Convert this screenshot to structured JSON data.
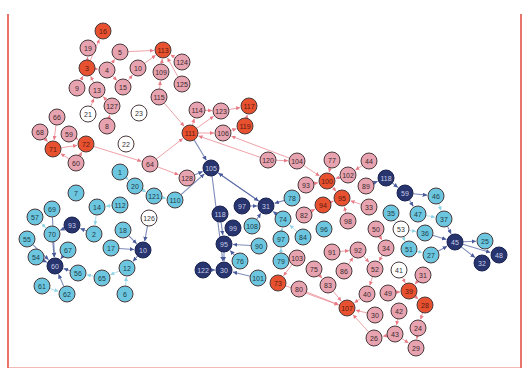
{
  "diagram": {
    "type": "network-graph",
    "node_radius": 8,
    "colors": {
      "hub_red": "#e8512f",
      "pink": "#e8a3b0",
      "white": "#ffffff",
      "light_blue": "#6cc6df",
      "navy": "#27346e",
      "edge_red": "#e87a86",
      "edge_blue": "#4a5b9c",
      "edge_lightblue": "#8fd3e6",
      "stroke": "#4a3a3c",
      "border": "#e8736a"
    },
    "nodes": [
      {
        "id": "16",
        "x": 103,
        "y": 31,
        "group": "hub_red"
      },
      {
        "id": "19",
        "x": 88,
        "y": 48,
        "group": "pink"
      },
      {
        "id": "5",
        "x": 120,
        "y": 52,
        "group": "pink"
      },
      {
        "id": "113",
        "x": 163,
        "y": 50,
        "group": "hub_red"
      },
      {
        "id": "124",
        "x": 182,
        "y": 62,
        "group": "pink"
      },
      {
        "id": "3",
        "x": 87,
        "y": 68,
        "group": "hub_red"
      },
      {
        "id": "4",
        "x": 107,
        "y": 70,
        "group": "pink"
      },
      {
        "id": "10",
        "x": 138,
        "y": 68,
        "group": "pink"
      },
      {
        "id": "109",
        "x": 161,
        "y": 72,
        "group": "pink"
      },
      {
        "id": "125",
        "x": 182,
        "y": 84,
        "group": "pink"
      },
      {
        "id": "9",
        "x": 77,
        "y": 88,
        "group": "pink"
      },
      {
        "id": "13",
        "x": 97,
        "y": 90,
        "group": "pink"
      },
      {
        "id": "15",
        "x": 123,
        "y": 87,
        "group": "pink"
      },
      {
        "id": "115",
        "x": 159,
        "y": 97,
        "group": "pink"
      },
      {
        "id": "127",
        "x": 112,
        "y": 106,
        "group": "pink"
      },
      {
        "id": "21",
        "x": 88,
        "y": 114,
        "group": "white"
      },
      {
        "id": "23",
        "x": 139,
        "y": 113,
        "group": "white"
      },
      {
        "id": "66",
        "x": 57,
        "y": 117,
        "group": "pink"
      },
      {
        "id": "68",
        "x": 40,
        "y": 132,
        "group": "pink"
      },
      {
        "id": "59",
        "x": 69,
        "y": 134,
        "group": "pink"
      },
      {
        "id": "8",
        "x": 107,
        "y": 126,
        "group": "pink"
      },
      {
        "id": "114",
        "x": 197,
        "y": 110,
        "group": "pink"
      },
      {
        "id": "123",
        "x": 221,
        "y": 111,
        "group": "pink"
      },
      {
        "id": "117",
        "x": 249,
        "y": 106,
        "group": "hub_red"
      },
      {
        "id": "71",
        "x": 53,
        "y": 149,
        "group": "hub_red"
      },
      {
        "id": "72",
        "x": 86,
        "y": 144,
        "group": "hub_red"
      },
      {
        "id": "22",
        "x": 126,
        "y": 144,
        "group": "white"
      },
      {
        "id": "111",
        "x": 190,
        "y": 133,
        "group": "hub_red"
      },
      {
        "id": "106",
        "x": 223,
        "y": 133,
        "group": "pink"
      },
      {
        "id": "119",
        "x": 245,
        "y": 126,
        "group": "hub_red"
      },
      {
        "id": "60",
        "x": 76,
        "y": 163,
        "group": "pink"
      },
      {
        "id": "64",
        "x": 150,
        "y": 164,
        "group": "pink"
      },
      {
        "id": "128",
        "x": 187,
        "y": 178,
        "group": "pink"
      },
      {
        "id": "105",
        "x": 211,
        "y": 168,
        "group": "navy"
      },
      {
        "id": "120",
        "x": 268,
        "y": 160,
        "group": "pink"
      },
      {
        "id": "104",
        "x": 297,
        "y": 161,
        "group": "pink"
      },
      {
        "id": "77",
        "x": 332,
        "y": 160,
        "group": "pink"
      },
      {
        "id": "44",
        "x": 369,
        "y": 161,
        "group": "pink"
      },
      {
        "id": "1",
        "x": 120,
        "y": 172,
        "group": "light_blue"
      },
      {
        "id": "20",
        "x": 135,
        "y": 186,
        "group": "light_blue"
      },
      {
        "id": "121",
        "x": 154,
        "y": 196,
        "group": "light_blue"
      },
      {
        "id": "110",
        "x": 175,
        "y": 200,
        "group": "light_blue"
      },
      {
        "id": "93",
        "x": 306,
        "y": 185,
        "group": "pink"
      },
      {
        "id": "100",
        "x": 327,
        "y": 181,
        "group": "hub_red"
      },
      {
        "id": "102",
        "x": 348,
        "y": 175,
        "group": "pink"
      },
      {
        "id": "89",
        "x": 366,
        "y": 186,
        "group": "pink"
      },
      {
        "id": "118",
        "x": 386,
        "y": 178,
        "group": "navy"
      },
      {
        "id": "7",
        "x": 76,
        "y": 193,
        "group": "light_blue"
      },
      {
        "id": "78",
        "x": 292,
        "y": 198,
        "group": "light_blue"
      },
      {
        "id": "94",
        "x": 323,
        "y": 205,
        "group": "hub_red"
      },
      {
        "id": "95",
        "x": 342,
        "y": 198,
        "group": "hub_red"
      },
      {
        "id": "33",
        "x": 369,
        "y": 207,
        "group": "pink"
      },
      {
        "id": "59b",
        "x": 405,
        "y": 193,
        "group": "navy",
        "label": "59"
      },
      {
        "id": "46",
        "x": 436,
        "y": 196,
        "group": "light_blue"
      },
      {
        "id": "57",
        "x": 35,
        "y": 217,
        "group": "light_blue"
      },
      {
        "id": "69",
        "x": 52,
        "y": 209,
        "group": "light_blue"
      },
      {
        "id": "14",
        "x": 97,
        "y": 207,
        "group": "light_blue"
      },
      {
        "id": "112",
        "x": 120,
        "y": 205,
        "group": "light_blue"
      },
      {
        "id": "126",
        "x": 149,
        "y": 218,
        "group": "white"
      },
      {
        "id": "97",
        "x": 242,
        "y": 206,
        "group": "navy"
      },
      {
        "id": "31",
        "x": 266,
        "y": 206,
        "group": "navy"
      },
      {
        "id": "118b",
        "x": 220,
        "y": 214,
        "group": "navy",
        "label": "118"
      },
      {
        "id": "74",
        "x": 283,
        "y": 219,
        "group": "light_blue"
      },
      {
        "id": "82",
        "x": 304,
        "y": 215,
        "group": "pink"
      },
      {
        "id": "96",
        "x": 324,
        "y": 229,
        "group": "light_blue"
      },
      {
        "id": "98",
        "x": 348,
        "y": 221,
        "group": "pink"
      },
      {
        "id": "50",
        "x": 376,
        "y": 229,
        "group": "pink"
      },
      {
        "id": "35",
        "x": 391,
        "y": 213,
        "group": "light_blue"
      },
      {
        "id": "47",
        "x": 418,
        "y": 214,
        "group": "light_blue"
      },
      {
        "id": "37",
        "x": 444,
        "y": 219,
        "group": "light_blue"
      },
      {
        "id": "53",
        "x": 401,
        "y": 229,
        "group": "white"
      },
      {
        "id": "36",
        "x": 425,
        "y": 233,
        "group": "light_blue"
      },
      {
        "id": "55",
        "x": 27,
        "y": 239,
        "group": "light_blue"
      },
      {
        "id": "70",
        "x": 52,
        "y": 234,
        "group": "light_blue"
      },
      {
        "id": "93b",
        "x": 72,
        "y": 225,
        "group": "navy",
        "label": "93"
      },
      {
        "id": "2",
        "x": 94,
        "y": 234,
        "group": "light_blue"
      },
      {
        "id": "18",
        "x": 123,
        "y": 230,
        "group": "light_blue"
      },
      {
        "id": "108",
        "x": 252,
        "y": 226,
        "group": "light_blue"
      },
      {
        "id": "99",
        "x": 233,
        "y": 228,
        "group": "navy"
      },
      {
        "id": "84",
        "x": 303,
        "y": 237,
        "group": "light_blue"
      },
      {
        "id": "97b",
        "x": 281,
        "y": 239,
        "group": "light_blue",
        "label": "97"
      },
      {
        "id": "90",
        "x": 259,
        "y": 246,
        "group": "light_blue"
      },
      {
        "id": "91",
        "x": 332,
        "y": 252,
        "group": "pink"
      },
      {
        "id": "92",
        "x": 358,
        "y": 250,
        "group": "pink"
      },
      {
        "id": "34",
        "x": 386,
        "y": 248,
        "group": "pink"
      },
      {
        "id": "61b",
        "x": 409,
        "y": 249,
        "group": "light_blue",
        "label": "51"
      },
      {
        "id": "27",
        "x": 431,
        "y": 255,
        "group": "light_blue"
      },
      {
        "id": "45",
        "x": 455,
        "y": 242,
        "group": "navy"
      },
      {
        "id": "25",
        "x": 485,
        "y": 241,
        "group": "light_blue"
      },
      {
        "id": "48",
        "x": 499,
        "y": 255,
        "group": "navy"
      },
      {
        "id": "32",
        "x": 482,
        "y": 263,
        "group": "navy"
      },
      {
        "id": "54",
        "x": 36,
        "y": 257,
        "group": "light_blue"
      },
      {
        "id": "67",
        "x": 68,
        "y": 250,
        "group": "light_blue"
      },
      {
        "id": "17",
        "x": 111,
        "y": 248,
        "group": "light_blue"
      },
      {
        "id": "10b",
        "x": 143,
        "y": 250,
        "group": "navy",
        "label": "10"
      },
      {
        "id": "95b",
        "x": 224,
        "y": 244,
        "group": "navy",
        "label": "95"
      },
      {
        "id": "79",
        "x": 281,
        "y": 261,
        "group": "light_blue"
      },
      {
        "id": "103",
        "x": 297,
        "y": 258,
        "group": "pink"
      },
      {
        "id": "75",
        "x": 314,
        "y": 269,
        "group": "pink"
      },
      {
        "id": "86",
        "x": 344,
        "y": 271,
        "group": "pink"
      },
      {
        "id": "52",
        "x": 375,
        "y": 269,
        "group": "pink"
      },
      {
        "id": "41",
        "x": 399,
        "y": 270,
        "group": "white"
      },
      {
        "id": "31b",
        "x": 423,
        "y": 275,
        "group": "pink",
        "label": "31"
      },
      {
        "id": "60b",
        "x": 55,
        "y": 266,
        "group": "navy",
        "label": "60"
      },
      {
        "id": "56",
        "x": 78,
        "y": 273,
        "group": "light_blue"
      },
      {
        "id": "65",
        "x": 102,
        "y": 278,
        "group": "light_blue"
      },
      {
        "id": "12",
        "x": 127,
        "y": 268,
        "group": "light_blue"
      },
      {
        "id": "76",
        "x": 240,
        "y": 261,
        "group": "light_blue"
      },
      {
        "id": "122",
        "x": 203,
        "y": 270,
        "group": "navy"
      },
      {
        "id": "30b",
        "x": 224,
        "y": 270,
        "group": "navy",
        "label": "30"
      },
      {
        "id": "101",
        "x": 258,
        "y": 278,
        "group": "light_blue"
      },
      {
        "id": "73",
        "x": 278,
        "y": 283,
        "group": "hub_red"
      },
      {
        "id": "80",
        "x": 299,
        "y": 289,
        "group": "pink"
      },
      {
        "id": "83",
        "x": 328,
        "y": 285,
        "group": "pink"
      },
      {
        "id": "40",
        "x": 367,
        "y": 294,
        "group": "pink"
      },
      {
        "id": "49",
        "x": 388,
        "y": 293,
        "group": "pink"
      },
      {
        "id": "39",
        "x": 409,
        "y": 291,
        "group": "hub_red"
      },
      {
        "id": "61",
        "x": 42,
        "y": 286,
        "group": "light_blue"
      },
      {
        "id": "62",
        "x": 67,
        "y": 294,
        "group": "light_blue"
      },
      {
        "id": "6",
        "x": 125,
        "y": 294,
        "group": "light_blue"
      },
      {
        "id": "107",
        "x": 347,
        "y": 308,
        "group": "hub_red"
      },
      {
        "id": "28b",
        "x": 425,
        "y": 305,
        "group": "hub_red",
        "label": "28"
      },
      {
        "id": "30",
        "x": 375,
        "y": 315,
        "group": "pink"
      },
      {
        "id": "42",
        "x": 399,
        "y": 311,
        "group": "pink"
      },
      {
        "id": "24",
        "x": 418,
        "y": 328,
        "group": "pink"
      },
      {
        "id": "26",
        "x": 374,
        "y": 338,
        "group": "pink"
      },
      {
        "id": "43",
        "x": 395,
        "y": 334,
        "group": "pink"
      },
      {
        "id": "29",
        "x": 416,
        "y": 348,
        "group": "pink"
      }
    ],
    "edges": [
      [
        "3",
        "16"
      ],
      [
        "3",
        "19"
      ],
      [
        "3",
        "4"
      ],
      [
        "4",
        "5"
      ],
      [
        "5",
        "113"
      ],
      [
        "10",
        "113"
      ],
      [
        "109",
        "113"
      ],
      [
        "124",
        "113"
      ],
      [
        "125",
        "113"
      ],
      [
        "4",
        "15"
      ],
      [
        "13",
        "3"
      ],
      [
        "9",
        "3"
      ],
      [
        "15",
        "10"
      ],
      [
        "115",
        "109"
      ],
      [
        "127",
        "13"
      ],
      [
        "21",
        "13"
      ],
      [
        "8",
        "127"
      ],
      [
        "66",
        "71"
      ],
      [
        "68",
        "71"
      ],
      [
        "59",
        "72"
      ],
      [
        "71",
        "72"
      ],
      [
        "60",
        "71"
      ],
      [
        "60",
        "72"
      ],
      [
        "72",
        "64"
      ],
      [
        "64",
        "128"
      ],
      [
        "128",
        "105"
      ],
      [
        "111",
        "114"
      ],
      [
        "111",
        "123"
      ],
      [
        "123",
        "117"
      ],
      [
        "119",
        "117"
      ],
      [
        "106",
        "119"
      ],
      [
        "111",
        "106"
      ],
      [
        "111",
        "105"
      ],
      [
        "115",
        "111"
      ],
      [
        "114",
        "123"
      ],
      [
        "120",
        "104"
      ],
      [
        "104",
        "100"
      ],
      [
        "77",
        "100"
      ],
      [
        "102",
        "100"
      ],
      [
        "44",
        "102"
      ],
      [
        "89",
        "118"
      ],
      [
        "93",
        "100"
      ],
      [
        "94",
        "95"
      ],
      [
        "100",
        "95"
      ],
      [
        "82",
        "94"
      ],
      [
        "98",
        "95"
      ],
      [
        "33",
        "95"
      ],
      [
        "118",
        "59b"
      ],
      [
        "59b",
        "46"
      ],
      [
        "59b",
        "47"
      ],
      [
        "47",
        "37"
      ],
      [
        "37",
        "45"
      ],
      [
        "45",
        "25"
      ],
      [
        "45",
        "48"
      ],
      [
        "45",
        "32"
      ],
      [
        "27",
        "45"
      ],
      [
        "36",
        "45"
      ],
      [
        "46",
        "37"
      ],
      [
        "1",
        "20"
      ],
      [
        "20",
        "121"
      ],
      [
        "121",
        "110"
      ],
      [
        "110",
        "105"
      ],
      [
        "112",
        "14"
      ],
      [
        "14",
        "2"
      ],
      [
        "2",
        "93b"
      ],
      [
        "93b",
        "70"
      ],
      [
        "70",
        "60b"
      ],
      [
        "69",
        "60b"
      ],
      [
        "57",
        "70"
      ],
      [
        "55",
        "60b"
      ],
      [
        "54",
        "60b"
      ],
      [
        "67",
        "60b"
      ],
      [
        "56",
        "60b"
      ],
      [
        "61",
        "62"
      ],
      [
        "62",
        "60b"
      ],
      [
        "65",
        "56"
      ],
      [
        "12",
        "65"
      ],
      [
        "17",
        "10b"
      ],
      [
        "18",
        "10b"
      ],
      [
        "126",
        "10b"
      ],
      [
        "10b",
        "12"
      ],
      [
        "6",
        "12"
      ],
      [
        "97",
        "31"
      ],
      [
        "118b",
        "95b"
      ],
      [
        "99",
        "95b"
      ],
      [
        "95b",
        "30b"
      ],
      [
        "122",
        "30b"
      ],
      [
        "76",
        "95b"
      ],
      [
        "101",
        "30b"
      ],
      [
        "31",
        "105"
      ],
      [
        "108",
        "31"
      ],
      [
        "74",
        "31"
      ],
      [
        "78",
        "31"
      ],
      [
        "84",
        "74"
      ],
      [
        "97b",
        "74"
      ],
      [
        "90",
        "95b"
      ],
      [
        "79",
        "97b"
      ],
      [
        "103",
        "73"
      ],
      [
        "73",
        "107"
      ],
      [
        "80",
        "107"
      ],
      [
        "83",
        "107"
      ],
      [
        "75",
        "83"
      ],
      [
        "86",
        "92"
      ],
      [
        "91",
        "92"
      ],
      [
        "92",
        "52"
      ],
      [
        "52",
        "40"
      ],
      [
        "40",
        "107"
      ],
      [
        "49",
        "39"
      ],
      [
        "39",
        "28b"
      ],
      [
        "41",
        "39"
      ],
      [
        "31b",
        "39"
      ],
      [
        "28b",
        "24"
      ],
      [
        "30",
        "107"
      ],
      [
        "42",
        "43"
      ],
      [
        "43",
        "26"
      ],
      [
        "26",
        "107"
      ],
      [
        "24",
        "29"
      ],
      [
        "43",
        "29"
      ],
      [
        "34",
        "52"
      ],
      [
        "50",
        "34"
      ],
      [
        "53",
        "36"
      ],
      [
        "51",
        "27"
      ],
      [
        "35",
        "61b"
      ],
      [
        "61b",
        "27"
      ],
      [
        "105",
        "30b"
      ],
      [
        "105",
        "31"
      ],
      [
        "64",
        "111"
      ],
      [
        "120",
        "111"
      ],
      [
        "104",
        "106"
      ]
    ]
  },
  "chart_data": {
    "type": "network",
    "node_groups": [
      "hub_red",
      "pink",
      "white",
      "light_blue",
      "navy"
    ],
    "node_count": 127
  }
}
